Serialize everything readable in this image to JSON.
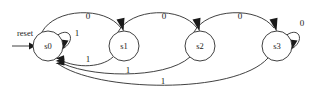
{
  "diagram": {
    "type": "finite-state-machine",
    "title": "",
    "width": 311,
    "height": 98,
    "background_color": "#ffffff",
    "stroke_color": "#2b2b2b",
    "text_color": "#1a1a1a"
  },
  "reset": {
    "label": "reset",
    "target_state": "s0"
  },
  "states": [
    {
      "id": "s0",
      "label": "s0",
      "cx": 48,
      "cy": 46,
      "r": 15
    },
    {
      "id": "s1",
      "label": "s1",
      "cx": 124,
      "cy": 46,
      "r": 15
    },
    {
      "id": "s2",
      "label": "s2",
      "cx": 200,
      "cy": 46,
      "r": 15
    },
    {
      "id": "s3",
      "label": "s3",
      "cx": 277,
      "cy": 46,
      "r": 15
    }
  ],
  "transitions": [
    {
      "id": "t-s0-s1",
      "from": "s0",
      "to": "s1",
      "label": "0",
      "label_x": 88,
      "label_y": 17
    },
    {
      "id": "t-s1-s2",
      "from": "s1",
      "to": "s2",
      "label": "0",
      "label_x": 164,
      "label_y": 17
    },
    {
      "id": "t-s2-s3",
      "from": "s2",
      "to": "s3",
      "label": "0",
      "label_x": 240,
      "label_y": 17
    },
    {
      "id": "t-s0-s0",
      "from": "s0",
      "to": "s0",
      "label": "1",
      "label_x": 77,
      "label_y": 34
    },
    {
      "id": "t-s3-s3",
      "from": "s3",
      "to": "s3",
      "label": "0",
      "label_x": 302,
      "label_y": 24
    },
    {
      "id": "t-s1-s0",
      "from": "s1",
      "to": "s0",
      "label": "1",
      "label_x": 88,
      "label_y": 60
    },
    {
      "id": "t-s2-s0",
      "from": "s2",
      "to": "s0",
      "label": "1",
      "label_x": 128,
      "label_y": 71
    },
    {
      "id": "t-s3-s0",
      "from": "s3",
      "to": "s0",
      "label": "1",
      "label_x": 163,
      "label_y": 82
    }
  ]
}
